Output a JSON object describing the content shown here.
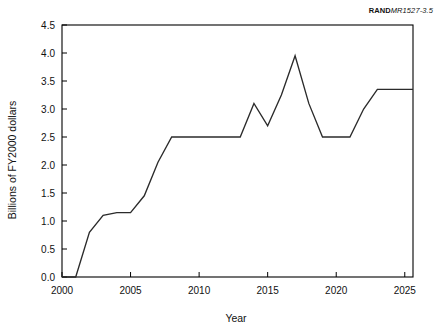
{
  "source_tag": {
    "brand": "RAND",
    "reference": "MR1527-3.5"
  },
  "chart_data": {
    "type": "line",
    "title": "",
    "subtitle": "",
    "xlabel": "Year",
    "ylabel": "Billions of FY2000 dollars",
    "xlim": [
      2000,
      2025.6
    ],
    "ylim": [
      0.0,
      4.5
    ],
    "xticks": [
      2000,
      2005,
      2010,
      2015,
      2020,
      2025
    ],
    "xtick_labels": [
      "2000",
      "2005",
      "2010",
      "2015",
      "2020",
      "2025"
    ],
    "yticks": [
      0.0,
      0.5,
      1.0,
      1.5,
      2.0,
      2.5,
      3.0,
      3.5,
      4.0,
      4.5
    ],
    "ytick_labels": [
      "0.0",
      "0.5",
      "1.0",
      "1.5",
      "2.0",
      "2.5",
      "3.0",
      "3.5",
      "4.0",
      "4.5"
    ],
    "grid": false,
    "legend": false,
    "legend_position": "none",
    "line_color": "#2b2b2b",
    "x": [
      2000.0,
      2001.0,
      2002.0,
      2003.0,
      2004.0,
      2005.0,
      2006.0,
      2007.0,
      2008.0,
      2009.0,
      2010.0,
      2011.0,
      2012.0,
      2013.0,
      2014.0,
      2015.0,
      2016.0,
      2017.0,
      2018.0,
      2019.0,
      2020.0,
      2021.0,
      2022.0,
      2023.0,
      2024.0,
      2025.0,
      2025.6
    ],
    "y": [
      0.0,
      0.0,
      0.8,
      1.1,
      1.15,
      1.15,
      1.45,
      2.05,
      2.5,
      2.5,
      2.5,
      2.5,
      2.5,
      2.5,
      3.1,
      2.7,
      3.25,
      3.95,
      3.1,
      2.5,
      2.5,
      2.5,
      3.0,
      3.35,
      3.35,
      3.35,
      3.35
    ],
    "series": [
      {
        "name": "Funding",
        "values": [
          0.0,
          0.0,
          0.8,
          1.1,
          1.15,
          1.15,
          1.45,
          2.05,
          2.5,
          2.5,
          2.5,
          2.5,
          2.5,
          2.5,
          3.1,
          2.7,
          3.25,
          3.95,
          3.1,
          2.5,
          2.5,
          2.5,
          3.0,
          3.35,
          3.35,
          3.35,
          3.35
        ]
      }
    ],
    "annotations": []
  }
}
